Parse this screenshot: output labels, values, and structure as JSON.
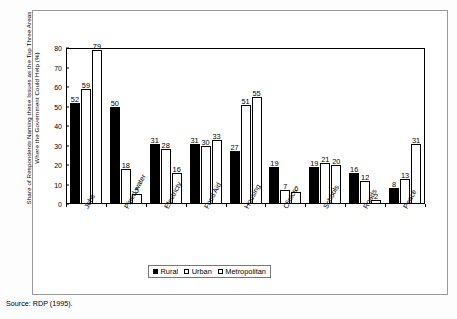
{
  "figure": {
    "source_note": "Source: RDP (1995)."
  },
  "chart_data": {
    "type": "bar",
    "title": "",
    "xlabel": "",
    "ylabel": "Share of Respondents Naming these Issues as the Top Three Areas Where the Government Could Help (%)",
    "ylabel_line1": "Share of Respondents Naming these Issues as the Top Three Areas",
    "ylabel_line2": "Where the Government Could Help (%)",
    "ylim": [
      0,
      80
    ],
    "yticks": [
      0,
      10,
      20,
      30,
      40,
      50,
      60,
      70,
      80
    ],
    "grid": false,
    "legend_position": "bottom",
    "categories": [
      "Jobs",
      "Piped water",
      "Electricty",
      "Food Aid",
      "Housing",
      "Clinics",
      "Schools",
      "Roads",
      "Peace"
    ],
    "series": [
      {
        "name": "Rural",
        "fill": "#000000",
        "values": [
          52,
          50,
          31,
          31,
          27,
          19,
          19,
          16,
          8
        ]
      },
      {
        "name": "Urban",
        "fill": "#ffffff",
        "values": [
          59,
          18,
          28,
          30,
          51,
          7,
          21,
          12,
          13
        ]
      },
      {
        "name": "Metropolitan",
        "fill": "#ffffff",
        "values": [
          79,
          5,
          16,
          33,
          55,
          6,
          20,
          2,
          31
        ]
      }
    ]
  }
}
